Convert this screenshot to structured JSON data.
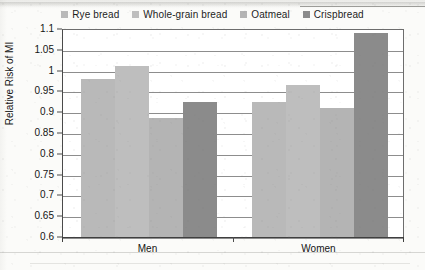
{
  "chart_data": {
    "type": "bar",
    "title": "",
    "xlabel": "",
    "ylabel": "Relative Risk of MI",
    "categories": [
      "Men",
      "Women"
    ],
    "series": [
      {
        "name": "Rye bread",
        "values": [
          0.98,
          0.925
        ],
        "color": "#b9b9b9"
      },
      {
        "name": "Whole-grain bread",
        "values": [
          1.01,
          0.965
        ],
        "color": "#bebebe"
      },
      {
        "name": "Oatmeal",
        "values": [
          0.885,
          0.91
        ],
        "color": "#b4b4b4"
      },
      {
        "name": "Crispbread",
        "values": [
          0.925,
          1.09
        ],
        "color": "#8b8b8b"
      }
    ],
    "ylim": [
      0.6,
      1.1
    ],
    "ytick_step": 0.05,
    "ytick_labels": [
      "1.1",
      "1.05",
      "1",
      "0.95",
      "0.9",
      "0.85",
      "0.8",
      "0.75",
      "0.7",
      "0.65",
      "0.6"
    ],
    "grid": true,
    "legend_position": "top"
  },
  "legend": {
    "items": [
      {
        "label": "Rye bread",
        "swatch_color": "#b9b9b9"
      },
      {
        "label": "Whole-grain bread",
        "swatch_color": "#bebebe"
      },
      {
        "label": "Oatmeal",
        "swatch_color": "#b4b4b4"
      },
      {
        "label": "Crispbread",
        "swatch_color": "#8b8b8b"
      }
    ]
  },
  "axes": {
    "y_title": "Relative Risk of MI",
    "x_groups": [
      "Men",
      "Women"
    ]
  }
}
